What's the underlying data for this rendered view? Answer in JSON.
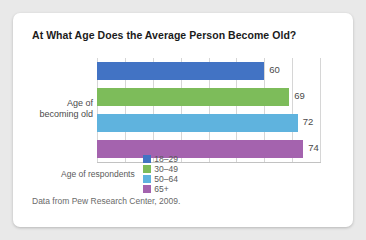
{
  "card": {
    "source_note": "Data from Pew Research Center, 2009."
  },
  "legend": {
    "title": "Age of respondents"
  },
  "chart_data": {
    "type": "bar",
    "orientation": "horizontal",
    "title": "At What Age Does the Average Person Become Old?",
    "xlabel": "",
    "ylabel": "Age of\nbecoming old",
    "ylabel_lines": [
      "Age of",
      "becoming old"
    ],
    "categories": [
      "18–29",
      "30–49",
      "50–64",
      "65+"
    ],
    "values": [
      60,
      69,
      72,
      74
    ],
    "value_labels": [
      "60",
      "69",
      "72",
      "74"
    ],
    "colors": [
      "#4273c4",
      "#7dbc5a",
      "#5fb3de",
      "#a463ae"
    ],
    "xlim": [
      0,
      80
    ],
    "xticks": [
      0,
      10,
      20,
      30,
      40,
      50,
      60,
      70,
      80
    ],
    "grid": "vertical",
    "tick_labels_visible": false,
    "legend_position": "bottom",
    "legend_entries": [
      {
        "label": "18–29",
        "color": "#4273c4"
      },
      {
        "label": "30–49",
        "color": "#7dbc5a"
      },
      {
        "label": "50–64",
        "color": "#5fb3de"
      },
      {
        "label": "65+",
        "color": "#a463ae"
      }
    ]
  }
}
